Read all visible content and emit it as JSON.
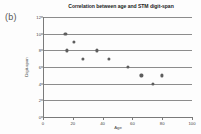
{
  "panel": {
    "label": "(b)"
  },
  "chart_data": {
    "type": "scatter",
    "title": "Correlation between age and STM digit-span",
    "xlabel": "Age",
    "ylabel": "Digit-span",
    "xlim": [
      0,
      100
    ],
    "ylim": [
      0,
      12
    ],
    "xticks": [
      0,
      20,
      40,
      60,
      80,
      100
    ],
    "yticks": [
      0,
      2,
      4,
      6,
      8,
      10,
      12
    ],
    "xtick_labels": [
      "0",
      "20",
      "40",
      "60",
      "80",
      "100"
    ],
    "ytick_labels": [
      "0",
      "2",
      "4",
      "6",
      "8",
      "10",
      "12"
    ],
    "grid": "horizontal",
    "legend": null,
    "marker_color": "#5d5d5d",
    "gridline_color": "#8c8c8c",
    "axis_color": "#7a7a7a",
    "x": [
      15,
      16,
      21,
      27,
      36,
      44,
      57,
      66,
      74,
      80
    ],
    "y": [
      10,
      8,
      9,
      7,
      8,
      7,
      6,
      5,
      4,
      5
    ],
    "points": [
      {
        "x": 15,
        "y": 10
      },
      {
        "x": 16,
        "y": 8
      },
      {
        "x": 21,
        "y": 9
      },
      {
        "x": 27,
        "y": 7
      },
      {
        "x": 36,
        "y": 8
      },
      {
        "x": 44,
        "y": 7
      },
      {
        "x": 57,
        "y": 6
      },
      {
        "x": 66,
        "y": 5
      },
      {
        "x": 74,
        "y": 4
      },
      {
        "x": 80,
        "y": 5
      }
    ]
  }
}
